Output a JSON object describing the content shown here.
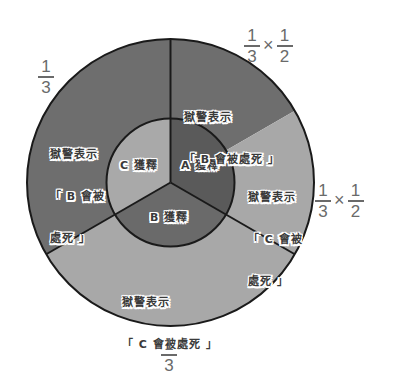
{
  "colors": {
    "outer_dark": "#6e6e6e",
    "outer_light": "#a8a8a8",
    "inner_A": "#5a5a5a",
    "inner_B": "#6a6a6a",
    "inner_C": "#a9a9a9",
    "stroke": "#1a1a1a",
    "fraction_text": "#6a6a6a"
  },
  "inner_ring": {
    "A": "A 獲釋",
    "B": "B 獲釋",
    "C": "C 獲釋"
  },
  "outer_ring": {
    "top_left": {
      "line1": "獄警表示",
      "line2": "「 B 會被",
      "line3": "處死 」"
    },
    "top_right": {
      "line1": "獄警表示",
      "line2": "「 B 會被處死 」"
    },
    "right": {
      "line1": "獄警表示",
      "line2": "「 C 會被",
      "line3": "處死 」"
    },
    "bottom": {
      "line1": "獄警表示",
      "line2": "「 C 會被處死 」"
    }
  },
  "probabilities": {
    "top_left": {
      "num": "1",
      "den": "3"
    },
    "top_right": {
      "a_num": "1",
      "a_den": "3",
      "op": "×",
      "b_num": "1",
      "b_den": "2"
    },
    "right": {
      "a_num": "1",
      "a_den": "3",
      "op": "×",
      "b_num": "1",
      "b_den": "2"
    },
    "bottom": {
      "num": "1",
      "den": "3"
    }
  }
}
